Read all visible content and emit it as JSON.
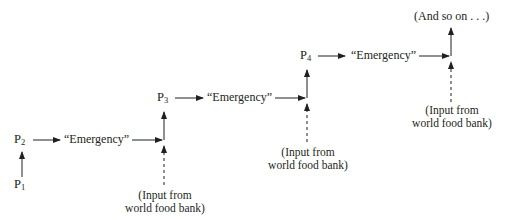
{
  "diagram": {
    "nodes": {
      "p1": {
        "base": "P",
        "sub": "1"
      },
      "p2": {
        "base": "P",
        "sub": "2"
      },
      "p3": {
        "base": "P",
        "sub": "3"
      },
      "p4": {
        "base": "P",
        "sub": "4"
      }
    },
    "emergency_labels": [
      "“Emergency”",
      "“Emergency”",
      "“Emergency”"
    ],
    "inputs": [
      {
        "line1": "(Input from",
        "line2": "world food bank)"
      },
      {
        "line1": "(Input from",
        "line2": "world food bank)"
      },
      {
        "line1": "(Input from",
        "line2": "world food bank)"
      }
    ],
    "continuation": "(And so on . . .)",
    "colors": {
      "ink": "#231f20",
      "background": "#ffffff"
    }
  }
}
